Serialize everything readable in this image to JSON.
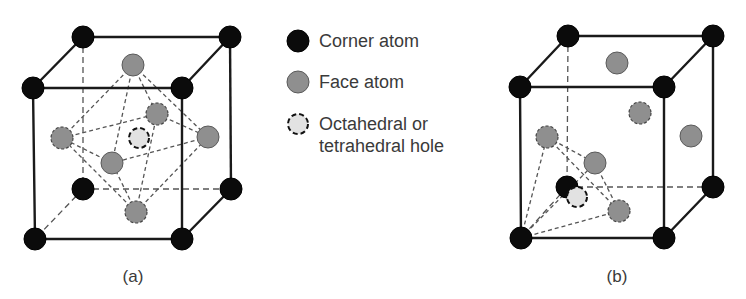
{
  "legend": {
    "items": [
      {
        "label": "Corner atom",
        "symbol": "corner-atom",
        "color": "#0b0b0b"
      },
      {
        "label": "Face atom",
        "symbol": "face-atom",
        "color": "#8f8f8f"
      },
      {
        "label_line1": "Octahedral or",
        "label_line2": "tetrahedral hole",
        "symbol": "hole",
        "color": "#e2e2e2"
      }
    ]
  },
  "panels": [
    {
      "label": "(a)",
      "depicts": "octahedral hole in face-centered cubic cell"
    },
    {
      "label": "(b)",
      "depicts": "tetrahedral hole in face-centered cubic cell"
    }
  ],
  "colors": {
    "corner": "#0b0b0b",
    "face": "#8f8f8f",
    "hole": "#e2e2e2",
    "edge": "#1a1a1a",
    "text": "#3a3a3a"
  }
}
